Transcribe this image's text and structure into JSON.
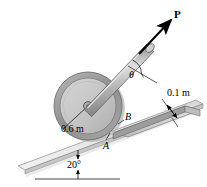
{
  "figure": {
    "type": "engineering-mechanics-free-body-diagram",
    "background_color": "#ffffff"
  },
  "labels": {
    "force": "P",
    "angle_rod": "θ",
    "point_a": "A",
    "point_b": "B",
    "wheel_radius": "0.6 m",
    "step_height": "0.1 m",
    "incline_angle": "20°"
  },
  "geometry": {
    "wheel": {
      "center_x": 88,
      "center_y": 106,
      "outer_radius": 34,
      "inner_radius": 28,
      "hub_radius": 4
    },
    "rod": {
      "start_x": 88,
      "start_y": 106,
      "end_x": 150,
      "end_y": 41,
      "half_width": 5
    },
    "force_arrow": {
      "start_x": 140,
      "start_y": 52,
      "end_x": 172,
      "end_y": 18
    },
    "incline_angle_deg": 20,
    "rod_angle_deg": 46
  },
  "colors": {
    "wheel_rim": "#9a9a9a",
    "wheel_face": "#c8c8c8",
    "wheel_shadow": "#b0b0b0",
    "rod_body": "#a8a8a8",
    "rod_highlight": "#d8d8d8",
    "incline_top": "#ececec",
    "incline_side": "#cfcfcf",
    "step_top": "#dcdcdc",
    "step_side": "#a5a5a5",
    "outline": "#6f6f6f",
    "ink": "#000000"
  }
}
